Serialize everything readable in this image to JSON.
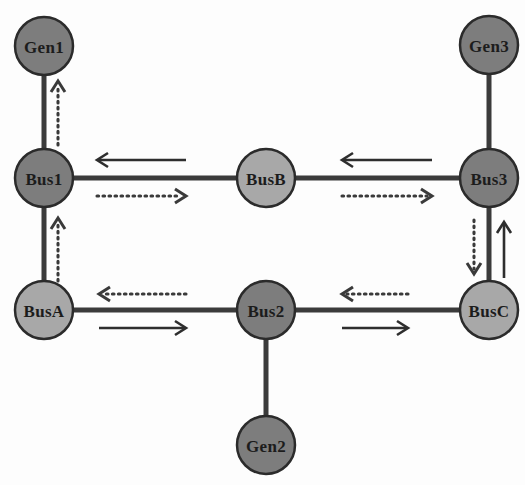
{
  "diagram": {
    "canvas": {
      "width": 525,
      "height": 485,
      "background": "#fdfdfd"
    },
    "colors": {
      "node_dark": "#7d7d7d",
      "node_light": "#a8a8a8",
      "node_stroke": "#2b2b2b",
      "edge": "#3b3b3b",
      "arrow_solid": "#2e2e2e",
      "arrow_dotted": "#3a3a3a",
      "label_text": "#1c1c1c"
    },
    "nodes": [
      {
        "id": "gen1",
        "label": "Gen1",
        "type": "generator",
        "shade": "dark",
        "cx": 44,
        "cy": 46,
        "r": 29
      },
      {
        "id": "gen3",
        "label": "Gen3",
        "type": "generator",
        "shade": "dark",
        "cx": 489,
        "cy": 45,
        "r": 29
      },
      {
        "id": "bus1",
        "label": "Bus1",
        "type": "bus",
        "shade": "dark",
        "cx": 44,
        "cy": 178,
        "r": 29
      },
      {
        "id": "busB",
        "label": "BusB",
        "type": "bus",
        "shade": "light",
        "cx": 266,
        "cy": 178,
        "r": 29
      },
      {
        "id": "bus3",
        "label": "Bus3",
        "type": "bus",
        "shade": "dark",
        "cx": 489,
        "cy": 178,
        "r": 29
      },
      {
        "id": "busA",
        "label": "BusA",
        "type": "bus",
        "shade": "light",
        "cx": 44,
        "cy": 310,
        "r": 29
      },
      {
        "id": "bus2",
        "label": "Bus2",
        "type": "bus",
        "shade": "dark",
        "cx": 266,
        "cy": 310,
        "r": 29
      },
      {
        "id": "busC",
        "label": "BusC",
        "type": "bus",
        "shade": "light",
        "cx": 489,
        "cy": 310,
        "r": 29
      },
      {
        "id": "gen2",
        "label": "Gen2",
        "type": "generator",
        "shade": "dark",
        "cx": 266,
        "cy": 445,
        "r": 29
      }
    ],
    "edges": [
      {
        "id": "e-gen1-bus1",
        "from": "gen1",
        "to": "bus1",
        "orientation": "vertical"
      },
      {
        "id": "e-bus1-busB",
        "from": "bus1",
        "to": "busB",
        "orientation": "horizontal"
      },
      {
        "id": "e-busB-bus3",
        "from": "busB",
        "to": "bus3",
        "orientation": "horizontal"
      },
      {
        "id": "e-gen3-bus3",
        "from": "gen3",
        "to": "bus3",
        "orientation": "vertical"
      },
      {
        "id": "e-bus1-busA",
        "from": "bus1",
        "to": "busA",
        "orientation": "vertical"
      },
      {
        "id": "e-bus3-busC",
        "from": "bus3",
        "to": "busC",
        "orientation": "vertical"
      },
      {
        "id": "e-busA-bus2",
        "from": "busA",
        "to": "bus2",
        "orientation": "horizontal"
      },
      {
        "id": "e-bus2-busC",
        "from": "bus2",
        "to": "busC",
        "orientation": "horizontal"
      },
      {
        "id": "e-bus2-gen2",
        "from": "bus2",
        "to": "gen2",
        "orientation": "vertical"
      }
    ],
    "flow_arrows": [
      {
        "id": "a-gen1-up",
        "edge": "e-gen1-bus1",
        "style": "dotted",
        "direction": "up",
        "x1": 58,
        "y1": 145,
        "x2": 58,
        "y2": 81
      },
      {
        "id": "a-bus1-busA-up",
        "edge": "e-bus1-busA",
        "style": "dotted",
        "direction": "up",
        "x1": 58,
        "y1": 281,
        "x2": 58,
        "y2": 218
      },
      {
        "id": "a-bus1-busB-left",
        "edge": "e-bus1-busB",
        "style": "solid",
        "direction": "left",
        "x1": 186,
        "y1": 160,
        "x2": 97,
        "y2": 160
      },
      {
        "id": "a-bus1-busB-right",
        "edge": "e-bus1-busB",
        "style": "dotted",
        "direction": "right",
        "x1": 97,
        "y1": 196,
        "x2": 186,
        "y2": 196
      },
      {
        "id": "a-busB-bus3-left",
        "edge": "e-busB-bus3",
        "style": "solid",
        "direction": "left",
        "x1": 432,
        "y1": 160,
        "x2": 342,
        "y2": 160
      },
      {
        "id": "a-busB-bus3-right",
        "edge": "e-busB-bus3",
        "style": "dotted",
        "direction": "right",
        "x1": 342,
        "y1": 196,
        "x2": 432,
        "y2": 196
      },
      {
        "id": "a-bus3-busC-down",
        "edge": "e-bus3-busC",
        "style": "dotted",
        "direction": "down",
        "x1": 474,
        "y1": 220,
        "x2": 474,
        "y2": 274
      },
      {
        "id": "a-bus3-busC-up",
        "edge": "e-bus3-busC",
        "style": "solid",
        "direction": "up",
        "x1": 504,
        "y1": 278,
        "x2": 504,
        "y2": 222
      },
      {
        "id": "a-busA-bus2-left",
        "edge": "e-busA-bus2",
        "style": "dotted",
        "direction": "left",
        "x1": 186,
        "y1": 294,
        "x2": 99,
        "y2": 294
      },
      {
        "id": "a-busA-bus2-right",
        "edge": "e-busA-bus2",
        "style": "solid",
        "direction": "right",
        "x1": 99,
        "y1": 328,
        "x2": 186,
        "y2": 328
      },
      {
        "id": "a-bus2-busC-left",
        "edge": "e-bus2-busC",
        "style": "dotted",
        "direction": "left",
        "x1": 408,
        "y1": 294,
        "x2": 342,
        "y2": 294
      },
      {
        "id": "a-bus2-busC-right",
        "edge": "e-bus2-busC",
        "style": "solid",
        "direction": "right",
        "x1": 342,
        "y1": 328,
        "x2": 408,
        "y2": 328
      }
    ]
  }
}
